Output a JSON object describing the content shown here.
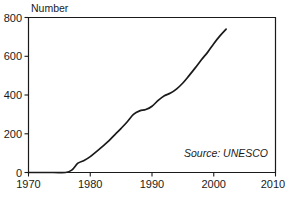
{
  "chart_data": {
    "type": "line",
    "title": "",
    "subtitle": "",
    "xlabel": "",
    "ylabel": "Number",
    "xlim": [
      1970,
      2010
    ],
    "ylim": [
      0,
      800
    ],
    "grid": false,
    "legend": null,
    "annotations": [
      {
        "name": "source-note",
        "text": "Source: UNESCO",
        "position": "bottom-right-inside-plot",
        "style": "italic"
      }
    ],
    "x_ticks": [
      1970,
      1980,
      1990,
      2000,
      2010
    ],
    "x_tick_labels": [
      "1970",
      "1980",
      "1990",
      "2000",
      "2010"
    ],
    "y_ticks": [
      0,
      200,
      400,
      600,
      800
    ],
    "y_tick_labels": [
      "0",
      "200",
      "400",
      "600",
      "800"
    ],
    "series": [
      {
        "name": "Number",
        "color": "#1a1a1a",
        "x": [
          1970,
          1974,
          1976,
          1977,
          1978,
          1979,
          1980,
          1981,
          1982,
          1983,
          1984,
          1985,
          1986,
          1987,
          1988,
          1989,
          1990,
          1991,
          1992,
          1993,
          1994,
          1995,
          1996,
          1997,
          1998,
          1999,
          2000,
          2001,
          2002
        ],
        "y": [
          0,
          0,
          0,
          12,
          48,
          62,
          82,
          108,
          135,
          163,
          196,
          228,
          262,
          300,
          318,
          325,
          342,
          372,
          396,
          410,
          432,
          462,
          500,
          540,
          582,
          620,
          665,
          705,
          740
        ]
      }
    ]
  },
  "axis": {
    "y_label": "Number"
  },
  "source": {
    "note": "Source: UNESCO"
  }
}
